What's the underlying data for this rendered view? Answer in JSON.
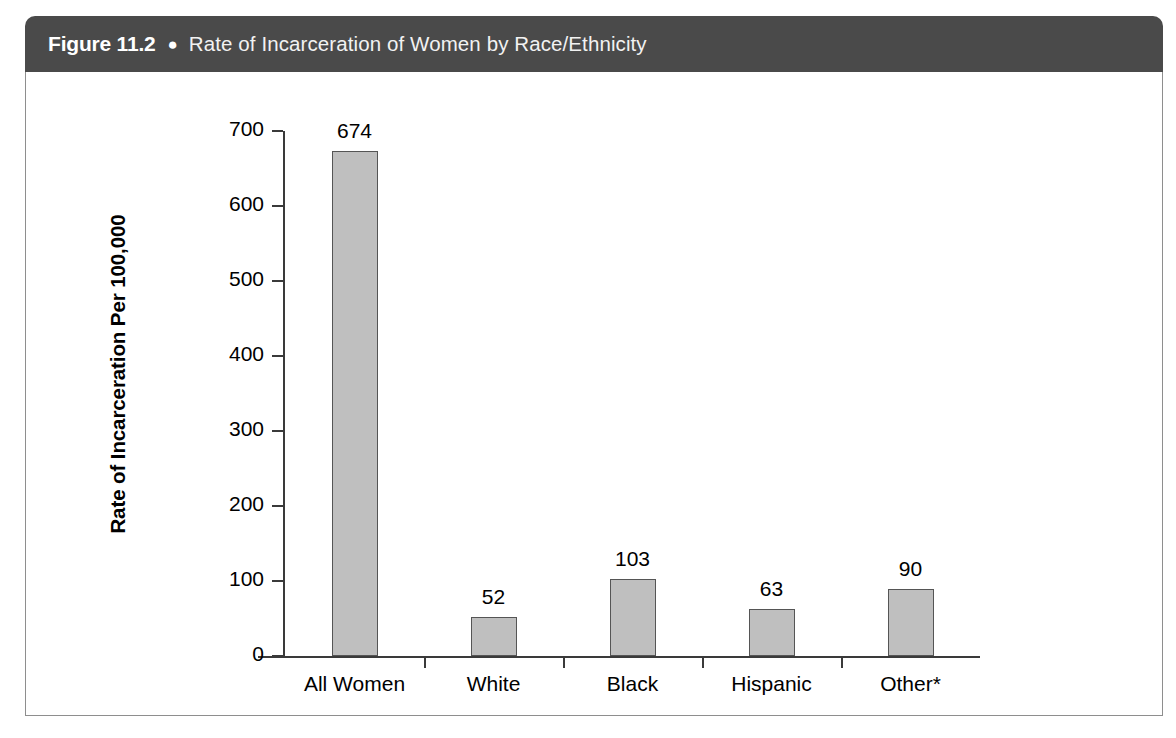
{
  "figure": {
    "number_label": "Figure 11.2",
    "bullet": "●",
    "title": "Rate of Incarceration of Women by Race/Ethnicity"
  },
  "chart_data": {
    "type": "bar",
    "title": "Rate of Incarceration of Women by Race/Ethnicity",
    "xlabel": "",
    "ylabel": "Rate of Incarceration Per 100,000",
    "categories": [
      "All Women",
      "White",
      "Black",
      "Hispanic",
      "Other*"
    ],
    "values": [
      674,
      52,
      103,
      63,
      90
    ],
    "value_labels": [
      "674",
      "52",
      "103",
      "63",
      "90"
    ],
    "ylim": [
      0,
      700
    ],
    "yticks": [
      0,
      100,
      200,
      300,
      400,
      500,
      600,
      700
    ],
    "ytick_labels": [
      "0",
      "100",
      "200",
      "300",
      "400",
      "500",
      "600",
      "700"
    ],
    "grid": false,
    "legend": false,
    "legend_position": "none",
    "bar_fill_color": "#bfbfbf",
    "bar_edge_color": "#555555",
    "axis_color": "#3a3a3a",
    "header_color": "#4a4a4a",
    "footnote_marker": "*"
  }
}
